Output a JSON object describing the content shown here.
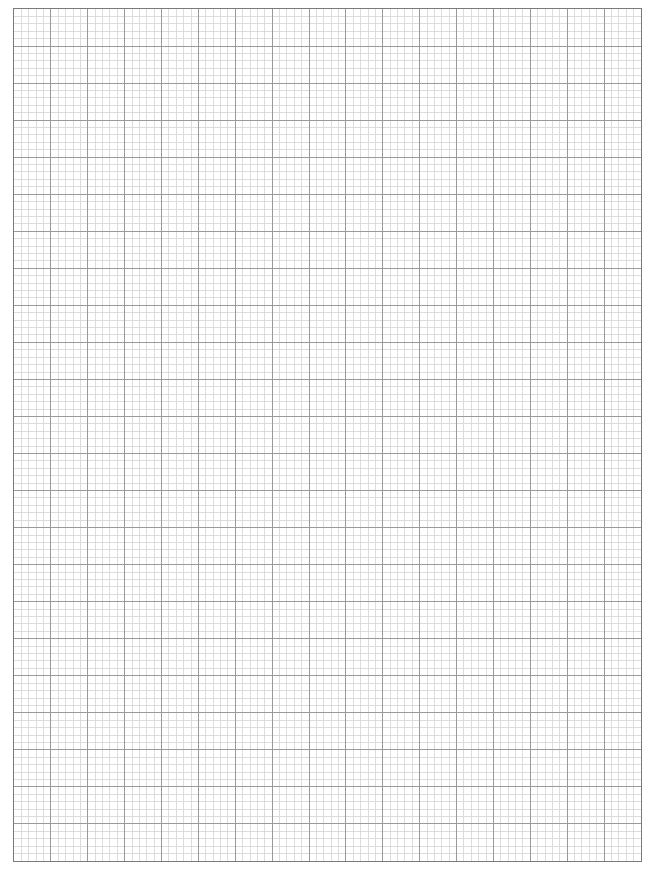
{
  "sheet": {
    "type": "graph-paper",
    "major_columns": 17,
    "major_rows": 23,
    "minor_divisions_per_major": 5,
    "colors": {
      "background": "#ffffff",
      "minor_line": "#d4d4d4",
      "major_line": "#9a9a9a",
      "border": "#7a7a7a"
    }
  }
}
